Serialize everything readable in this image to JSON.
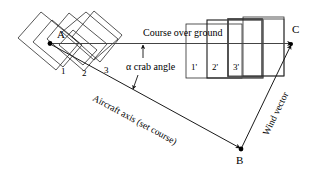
{
  "figure": {
    "background_color": "#ffffff",
    "line_color": "#2b2b2b",
    "accent_color": "#555555"
  },
  "points": {
    "a": "A",
    "b": "B",
    "c": "C"
  },
  "labels": {
    "course_over_ground": "Course over ground",
    "crab_angle": "α crab angle",
    "aircraft_axis": "Aircraft axis (set course)",
    "wind_vector": "Wind vector"
  },
  "left_frames": [
    {
      "id": "frame-1",
      "label": "1"
    },
    {
      "id": "frame-2",
      "label": "2"
    },
    {
      "id": "frame-3",
      "label": "3"
    }
  ],
  "right_frames": [
    {
      "id": "frame-1-prime",
      "label": "1'"
    },
    {
      "id": "frame-2-prime",
      "label": "2'"
    },
    {
      "id": "frame-3-prime",
      "label": "3'"
    }
  ],
  "vectors": [
    {
      "id": "course-over-ground-vector",
      "from": "A",
      "to": "C"
    },
    {
      "id": "aircraft-axis-vector",
      "from": "A",
      "to": "B"
    },
    {
      "id": "wind-vector",
      "from": "B",
      "to": "C"
    }
  ],
  "angle_marker": {
    "name": "crab-angle-marker",
    "symbol": "α"
  }
}
